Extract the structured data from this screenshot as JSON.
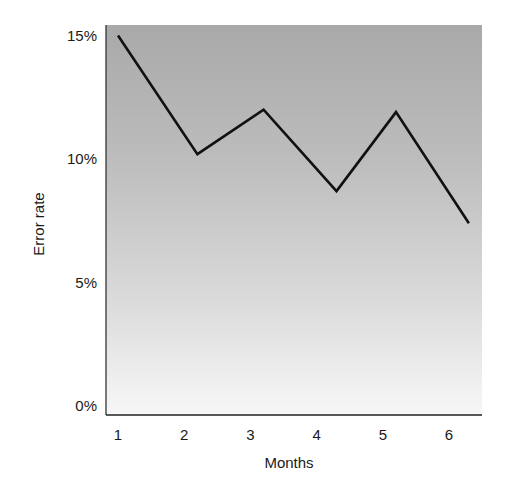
{
  "chart_data": {
    "type": "line",
    "title": "",
    "xlabel": "Months",
    "ylabel": "Error rate",
    "categories": [
      "1",
      "2",
      "3",
      "4",
      "5",
      "6"
    ],
    "x_tick_labels": [
      "1",
      "2",
      "3",
      "4",
      "5",
      "6"
    ],
    "y_tick_labels": [
      "0%",
      "5%",
      "10%",
      "15%"
    ],
    "y_ticks": [
      0,
      5,
      10,
      15
    ],
    "ylim": [
      0,
      15.8
    ],
    "grid": false,
    "legend": null,
    "series": [
      {
        "name": "Error rate",
        "x": [
          1.0,
          2.2,
          3.2,
          4.3,
          5.2,
          6.3
        ],
        "values": [
          15.0,
          10.2,
          12.0,
          8.7,
          11.9,
          7.4
        ],
        "color": "#111111"
      }
    ],
    "background": {
      "gradient_top": "#a9a9a9",
      "gradient_bottom": "#f7f7f7"
    }
  }
}
